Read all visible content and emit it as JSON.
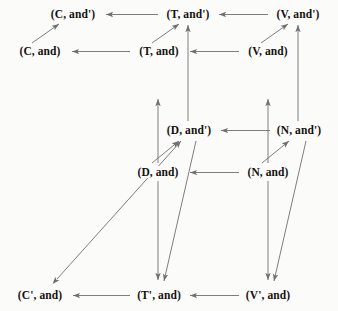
{
  "diagram": {
    "type": "commutative-diagram",
    "background_color": "#fbfbfa",
    "edge_color": "#6f6f72",
    "text_color": "#15110f",
    "width": 338,
    "height": 311,
    "nodes": [
      {
        "id": "c-prime-and",
        "label": "(C, and')",
        "x": 73,
        "y": 14
      },
      {
        "id": "t-prime-and",
        "label": "(T, and')",
        "x": 188,
        "y": 14
      },
      {
        "id": "v-prime-and",
        "label": "(V, and')",
        "x": 298,
        "y": 14
      },
      {
        "id": "c-and",
        "label": "(C, and)",
        "x": 40,
        "y": 51
      },
      {
        "id": "t-and",
        "label": "(T, and)",
        "x": 159,
        "y": 51
      },
      {
        "id": "v-and",
        "label": "(V, and)",
        "x": 268,
        "y": 51
      },
      {
        "id": "d-prime-and",
        "label": "(D, and')",
        "x": 189,
        "y": 130
      },
      {
        "id": "n-prime-and",
        "label": "(N, and')",
        "x": 299,
        "y": 130
      },
      {
        "id": "d-and",
        "label": "(D, and)",
        "x": 158,
        "y": 172
      },
      {
        "id": "n-and",
        "label": "(N, and)",
        "x": 268,
        "y": 172
      },
      {
        "id": "c2-and",
        "label": "(C', and)",
        "x": 40,
        "y": 295
      },
      {
        "id": "t2-and",
        "label": "(T', and)",
        "x": 159,
        "y": 295
      },
      {
        "id": "v2-and",
        "label": "(V', and)",
        "x": 268,
        "y": 295
      }
    ],
    "edges": [
      {
        "id": "e1",
        "from": "t-prime-and",
        "to": "c-prime-and",
        "kind": "horizontal",
        "arrow": "single"
      },
      {
        "id": "e2",
        "from": "v-prime-and",
        "to": "t-prime-and",
        "kind": "horizontal",
        "arrow": "single"
      },
      {
        "id": "e3",
        "from": "t-and",
        "to": "c-and",
        "kind": "horizontal",
        "arrow": "single"
      },
      {
        "id": "e4",
        "from": "v-and",
        "to": "t-and",
        "kind": "horizontal",
        "arrow": "single"
      },
      {
        "id": "e5",
        "from": "n-prime-and",
        "to": "d-prime-and",
        "kind": "horizontal",
        "arrow": "single"
      },
      {
        "id": "e6",
        "from": "n-and",
        "to": "d-and",
        "kind": "horizontal",
        "arrow": "single"
      },
      {
        "id": "e7",
        "from": "t2-and",
        "to": "c2-and",
        "kind": "horizontal",
        "arrow": "single"
      },
      {
        "id": "e8",
        "from": "v2-and",
        "to": "t2-and",
        "kind": "horizontal",
        "arrow": "single"
      },
      {
        "id": "e9",
        "from": "c-and",
        "to": "c-prime-and",
        "kind": "diagonal",
        "arrow": "single"
      },
      {
        "id": "e10",
        "from": "t-and",
        "to": "t-prime-and",
        "kind": "diagonal",
        "arrow": "single"
      },
      {
        "id": "e11",
        "from": "v-and",
        "to": "v-prime-and",
        "kind": "diagonal",
        "arrow": "single"
      },
      {
        "id": "e12",
        "from": "d-and",
        "to": "d-prime-and",
        "kind": "diagonal",
        "arrow": "single"
      },
      {
        "id": "e13",
        "from": "n-and",
        "to": "n-prime-and",
        "kind": "diagonal",
        "arrow": "single"
      },
      {
        "id": "e14",
        "from": "d-prime-and",
        "to": "t-prime-and",
        "kind": "vertical",
        "arrow": "single"
      },
      {
        "id": "e15",
        "from": "n-prime-and",
        "to": "v-prime-and",
        "kind": "vertical",
        "arrow": "single"
      },
      {
        "id": "e16",
        "from": "d-and",
        "to": "t-and",
        "kind": "vertical",
        "arrow": "single"
      },
      {
        "id": "e17",
        "from": "n-and",
        "to": "v-and",
        "kind": "vertical",
        "arrow": "single"
      },
      {
        "id": "e18",
        "from": "d-and",
        "to": "t2-and",
        "kind": "vertical",
        "arrow": "single"
      },
      {
        "id": "e19",
        "from": "n-and",
        "to": "v2-and",
        "kind": "vertical",
        "arrow": "single"
      },
      {
        "id": "e20",
        "from": "d-prime-and",
        "to": "t2-and",
        "kind": "diagonal",
        "arrow": "single"
      },
      {
        "id": "e21",
        "from": "n-prime-and",
        "to": "v2-and",
        "kind": "diagonal",
        "arrow": "single"
      },
      {
        "id": "e22",
        "from": "c2-and",
        "to": "d-prime-and",
        "kind": "diagonal",
        "arrow": "double"
      }
    ]
  }
}
